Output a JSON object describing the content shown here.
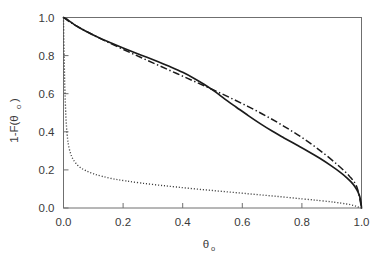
{
  "chart_data": {
    "type": "line",
    "title": "",
    "subtitle": "",
    "xlabel": "θ",
    "xlabel_sub": "o",
    "ylabel": "1-F(θ",
    "ylabel_sub": "o",
    "ylabel_tail": ")",
    "xlim": [
      0.0,
      1.0
    ],
    "ylim": [
      0.0,
      1.0
    ],
    "grid": false,
    "legend": "none",
    "xticks": [
      0.0,
      0.2,
      0.4,
      0.6,
      0.8,
      1.0
    ],
    "xticklabels": [
      "0.0",
      "0.2",
      "0.4",
      "0.6",
      "0.8",
      "1.0"
    ],
    "yticks": [
      0.0,
      0.2,
      0.4,
      0.6,
      0.8,
      1.0
    ],
    "yticklabels": [
      "0.0",
      "0.2",
      "0.4",
      "0.6",
      "0.8",
      "1.0"
    ],
    "series": [
      {
        "name": "solid-curve",
        "style": "solid",
        "color": "#1b1b1b",
        "x": [
          0.0,
          0.01,
          0.02,
          0.035,
          0.05,
          0.075,
          0.1,
          0.13,
          0.16,
          0.2,
          0.24,
          0.28,
          0.32,
          0.36,
          0.4,
          0.44,
          0.47,
          0.5,
          0.52,
          0.55,
          0.58,
          0.62,
          0.66,
          0.7,
          0.74,
          0.78,
          0.82,
          0.86,
          0.9,
          0.93,
          0.95,
          0.965,
          0.978,
          0.988,
          0.994,
          0.998,
          1.0
        ],
        "y": [
          1.0,
          0.992,
          0.981,
          0.964,
          0.95,
          0.928,
          0.908,
          0.886,
          0.866,
          0.84,
          0.815,
          0.791,
          0.766,
          0.74,
          0.712,
          0.679,
          0.651,
          0.62,
          0.598,
          0.562,
          0.529,
          0.485,
          0.443,
          0.404,
          0.368,
          0.333,
          0.298,
          0.261,
          0.22,
          0.186,
          0.16,
          0.137,
          0.112,
          0.085,
          0.06,
          0.03,
          0.0
        ]
      },
      {
        "name": "dash-dot-curve",
        "style": "dashdot",
        "color": "#1b1b1b",
        "x": [
          0.0,
          0.02,
          0.05,
          0.09,
          0.14,
          0.2,
          0.26,
          0.32,
          0.38,
          0.44,
          0.5,
          0.56,
          0.62,
          0.68,
          0.74,
          0.8,
          0.86,
          0.92,
          0.96,
          0.985,
          1.0
        ],
        "y": [
          1.0,
          0.978,
          0.95,
          0.916,
          0.877,
          0.833,
          0.79,
          0.748,
          0.706,
          0.664,
          0.622,
          0.578,
          0.532,
          0.483,
          0.429,
          0.37,
          0.303,
          0.226,
          0.166,
          0.108,
          0.0
        ]
      },
      {
        "name": "dotted-curve",
        "style": "dotted",
        "color": "#3d3d3d",
        "x": [
          0.0,
          0.002,
          0.004,
          0.007,
          0.01,
          0.014,
          0.018,
          0.024,
          0.03,
          0.04,
          0.055,
          0.075,
          0.1,
          0.13,
          0.17,
          0.21,
          0.26,
          0.32,
          0.38,
          0.45,
          0.52,
          0.59,
          0.66,
          0.73,
          0.8,
          0.86,
          0.91,
          0.95,
          0.975,
          0.99,
          1.0
        ],
        "y": [
          1.0,
          0.82,
          0.66,
          0.52,
          0.43,
          0.36,
          0.32,
          0.285,
          0.262,
          0.238,
          0.214,
          0.196,
          0.18,
          0.166,
          0.152,
          0.142,
          0.131,
          0.12,
          0.11,
          0.099,
          0.089,
          0.079,
          0.069,
          0.059,
          0.048,
          0.039,
          0.03,
          0.021,
          0.013,
          0.005,
          0.0
        ]
      }
    ]
  }
}
